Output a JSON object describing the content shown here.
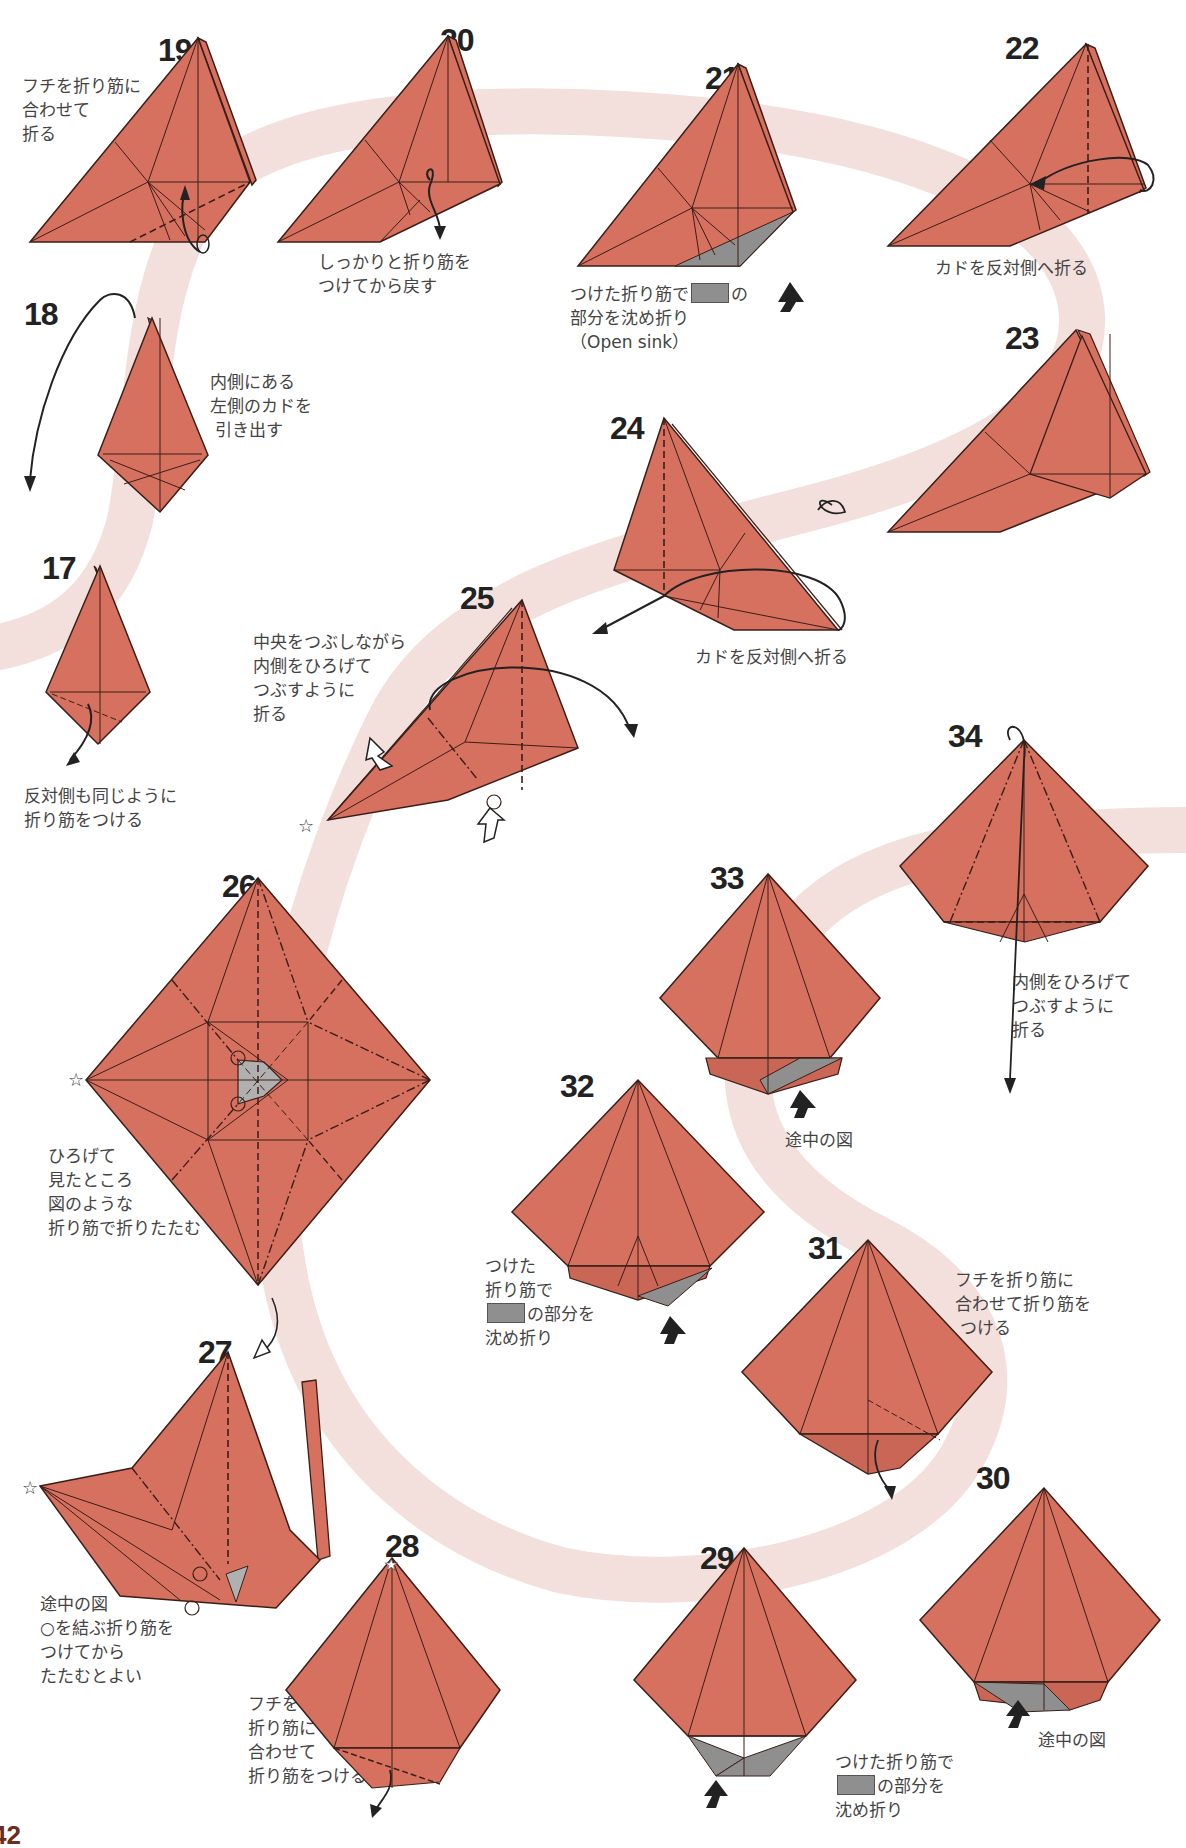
{
  "page": {
    "page_number": "42",
    "paper_color": "#d6705f",
    "crease_color": "#3a1e18",
    "sink_color": "#8f8f8f",
    "path_color": "#f2dcd8"
  },
  "steps": [
    {
      "number": "17",
      "caption": "反対側も同じように\n折り筋をつける"
    },
    {
      "number": "18",
      "caption": "内側にある\n左側のカドを\n 引き出す"
    },
    {
      "number": "19",
      "caption": "フチを折り筋に\n合わせて\n折る"
    },
    {
      "number": "20",
      "caption": "しっかりと折り筋を\nつけてから戻す"
    },
    {
      "number": "21",
      "caption_pre": "つけた折り筋で",
      "caption_post": "の\n部分を沈め折り\n（Open sink）"
    },
    {
      "number": "22",
      "caption": "カドを反対側へ折る"
    },
    {
      "number": "23",
      "caption": ""
    },
    {
      "number": "24",
      "caption": "カドを反対側へ折る"
    },
    {
      "number": "25",
      "caption": "中央をつぶしながら\n内側をひろげて\nつぶすように\n折る"
    },
    {
      "number": "26",
      "caption": "ひろげて\n見たところ\n図のような\n折り筋で折りたたむ"
    },
    {
      "number": "27",
      "caption": "途中の図\n○を結ぶ折り筋を\nつけてから\nたたむとよい"
    },
    {
      "number": "28",
      "caption": "フチを\n折り筋に\n合わせて\n折り筋をつける"
    },
    {
      "number": "29",
      "caption_pre": "つけた折り筋で\n",
      "caption_post": "の部分を\n沈め折り"
    },
    {
      "number": "30",
      "caption": "途中の図"
    },
    {
      "number": "31",
      "caption": "フチを折り筋に\n合わせて折り筋を\n つける"
    },
    {
      "number": "32",
      "caption_pre": "つけた\n折り筋で\n",
      "caption_post": "の部分を\n沈め折り"
    },
    {
      "number": "33",
      "caption": "途中の図"
    },
    {
      "number": "34",
      "caption": "内側をひろげて\nつぶすように\n折る"
    }
  ],
  "symbols": {
    "star": "☆",
    "circle": "○"
  }
}
